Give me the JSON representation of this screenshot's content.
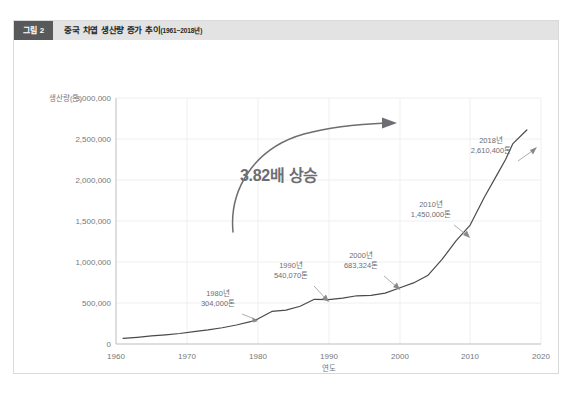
{
  "figure": {
    "badge": "그림 2",
    "title": "중국 차엽 생산량 증가 추이",
    "subtitle": "(1961~2018년)"
  },
  "colors": {
    "header_bar": "#e3e3e3",
    "badge_bg": "#58595b",
    "line": "#4a4a4a",
    "grid": "#efeff0",
    "axis": "#bcbdbf",
    "text": "#76777a",
    "annotation": "#6d6e71",
    "frame_border": "#d9dadb"
  },
  "chart_data": {
    "type": "line",
    "xlabel": "연도",
    "ylabel": "생산량(톤)",
    "xlim": [
      1960,
      2020
    ],
    "ylim": [
      0,
      3000000
    ],
    "grid": true,
    "legend": "none",
    "x_ticks": [
      "1960",
      "1970",
      "1980",
      "1990",
      "2000",
      "2010",
      "2020"
    ],
    "y_ticks": [
      "0",
      "500,000",
      "1,000,000",
      "1,500,000",
      "2,000,000",
      "2,500,000",
      "3,000,000"
    ],
    "series": [
      {
        "name": "중국 차엽 생산량",
        "x": [
          1961,
          1963,
          1965,
          1967,
          1969,
          1971,
          1973,
          1975,
          1977,
          1979,
          1980,
          1982,
          1984,
          1986,
          1988,
          1990,
          1992,
          1994,
          1996,
          1998,
          2000,
          2002,
          2004,
          2006,
          2008,
          2010,
          2012,
          2014,
          2015,
          2016,
          2018
        ],
        "values": [
          68000,
          82000,
          98000,
          112000,
          128000,
          150000,
          172000,
          198000,
          232000,
          272000,
          304000,
          397000,
          414000,
          460000,
          545000,
          540070,
          560000,
          588000,
          593000,
          620000,
          683324,
          745000,
          835000,
          1028000,
          1257000,
          1450000,
          1790000,
          2096000,
          2249000,
          2440000,
          2610400
        ]
      }
    ],
    "annotations": [
      {
        "name": "1980",
        "year_label": "1980년",
        "value_label": "304,000톤",
        "x": 1980,
        "y": 304000
      },
      {
        "name": "1990",
        "year_label": "1990년",
        "value_label": "540,070톤",
        "x": 1990,
        "y": 540070
      },
      {
        "name": "2000",
        "year_label": "2000년",
        "value_label": "683,324톤",
        "x": 2000,
        "y": 683324
      },
      {
        "name": "2010",
        "year_label": "2010년",
        "value_label": "1,450,000톤",
        "x": 2010,
        "y": 1450000
      },
      {
        "name": "2018",
        "year_label": "2018년",
        "value_label": "2,610,400톤",
        "x": 2018,
        "y": 2610400
      }
    ],
    "callout": {
      "text": "3.82배 상승",
      "multiplier": 3.82
    }
  }
}
